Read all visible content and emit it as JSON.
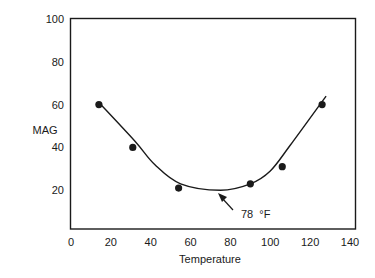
{
  "chart_data": {
    "type": "scatter",
    "title": "",
    "xlabel": "Temperature",
    "ylabel": "MAG",
    "xlim": [
      0,
      140
    ],
    "ylim": [
      2,
      100
    ],
    "xticks": [
      0,
      20,
      40,
      60,
      80,
      100,
      120,
      140
    ],
    "yticks": [
      20,
      40,
      60,
      80,
      100
    ],
    "grid": false,
    "legend": null,
    "series": [
      {
        "name": "measured",
        "kind": "scatter",
        "marker": "filled-circle",
        "x": [
          14,
          31,
          54,
          90,
          106,
          126
        ],
        "y": [
          60,
          40,
          21,
          23,
          31,
          60
        ]
      },
      {
        "name": "fitted-curve",
        "kind": "line",
        "x": [
          14,
          32,
          42,
          55,
          75,
          90,
          100,
          110,
          128
        ],
        "y": [
          61,
          43,
          32,
          23,
          20,
          23,
          29,
          41,
          64
        ]
      }
    ],
    "annotations": [
      {
        "text": "78 °F",
        "arrow_to": [
          75,
          20
        ],
        "text_at": [
          86,
          8
        ]
      }
    ]
  },
  "labels": {
    "x_axis": "Temperature",
    "y_axis": "MAG",
    "annotation_value": "78",
    "annotation_unit": "°F"
  },
  "colors": {
    "ink": "#1a1a1a",
    "background": "#ffffff"
  }
}
